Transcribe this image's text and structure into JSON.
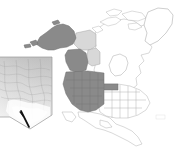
{
  "figure": {
    "type": "map",
    "background_color": "#ffffff",
    "width_px": 176,
    "height_px": 149
  },
  "colors": {
    "highlight_fill": "#8a8a8a",
    "secondary_fill": "#d8d8d8",
    "unshaded_fill": "#ffffff",
    "outline": "#a9a9a9",
    "outline_dark": "#6f6f6f",
    "inset_border": "#9a9a9a",
    "marker_color": "#111111",
    "terrain_high": "#ffffff",
    "terrain_mid": "#c9c9c9",
    "terrain_low": "#9e9e9e"
  },
  "legend": {
    "highlight_label": "Highlighted region",
    "secondary_label": "Adjacent region",
    "unshaded_label": "Other land"
  },
  "basemap": {
    "name": "north-america-basemap",
    "regions": [
      {
        "id": "alaska",
        "label": "Alaska",
        "shade": "highlight"
      },
      {
        "id": "yukon",
        "label": "Yukon",
        "shade": "secondary"
      },
      {
        "id": "british-columbia",
        "label": "British Columbia",
        "shade": "highlight"
      },
      {
        "id": "alberta",
        "label": "Alberta",
        "shade": "secondary"
      },
      {
        "id": "washington",
        "label": "Washington",
        "shade": "highlight"
      },
      {
        "id": "oregon",
        "label": "Oregon",
        "shade": "highlight"
      },
      {
        "id": "idaho",
        "label": "Idaho",
        "shade": "highlight"
      },
      {
        "id": "montana",
        "label": "Montana",
        "shade": "highlight"
      },
      {
        "id": "wyoming",
        "label": "Wyoming",
        "shade": "highlight"
      },
      {
        "id": "california",
        "label": "California",
        "shade": "highlight"
      },
      {
        "id": "nevada",
        "label": "Nevada",
        "shade": "highlight"
      },
      {
        "id": "utah",
        "label": "Utah",
        "shade": "highlight"
      },
      {
        "id": "colorado",
        "label": "Colorado",
        "shade": "highlight"
      },
      {
        "id": "arizona",
        "label": "Arizona",
        "shade": "highlight"
      },
      {
        "id": "new-mexico",
        "label": "New Mexico",
        "shade": "highlight"
      },
      {
        "id": "north-dakota",
        "label": "North Dakota",
        "shade": "highlight"
      },
      {
        "id": "south-dakota",
        "label": "South Dakota",
        "shade": "highlight"
      },
      {
        "id": "nebraska",
        "label": "Nebraska",
        "shade": "highlight"
      },
      {
        "id": "kansas",
        "label": "Kansas",
        "shade": "highlight"
      },
      {
        "id": "canada-east",
        "label": "Eastern Canada",
        "shade": "unshaded"
      },
      {
        "id": "greenland",
        "label": "Greenland",
        "shade": "unshaded"
      },
      {
        "id": "united-states-east",
        "label": "Eastern United States",
        "shade": "unshaded"
      },
      {
        "id": "mexico",
        "label": "Mexico",
        "shade": "unshaded"
      },
      {
        "id": "hudson-bay",
        "label": "Hudson Bay",
        "shade": "water"
      }
    ]
  },
  "inset": {
    "name": "nevada-inset",
    "label": "Nevada",
    "map_type": "shaded relief / elevation",
    "has_border": true,
    "marker": {
      "name": "site-marker",
      "label": "Study site",
      "style": "black diagonal line",
      "position_hint": "south-western Nevada"
    }
  },
  "annotations": {
    "corner_mark": ""
  }
}
